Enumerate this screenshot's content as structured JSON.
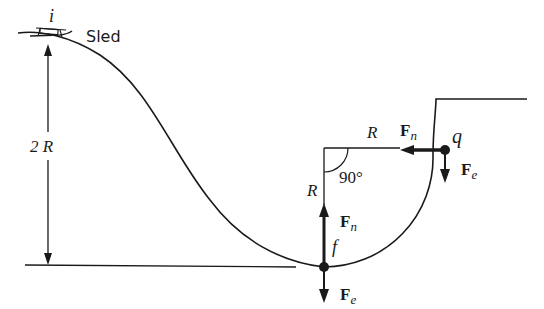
{
  "diagram": {
    "labels": {
      "point_i": "i",
      "sled": "Sled",
      "height": "2 R",
      "radius_horizontal": "R",
      "radius_vertical": "R",
      "angle": "90°",
      "point_f": "f",
      "point_q": "q"
    },
    "forces": {
      "at_f": [
        {
          "symbol": "F",
          "subscript": "n",
          "direction": "up"
        },
        {
          "symbol": "F",
          "subscript": "e",
          "direction": "down"
        }
      ],
      "at_q": [
        {
          "symbol": "F",
          "subscript": "n",
          "direction": "left"
        },
        {
          "symbol": "F",
          "subscript": "e",
          "direction": "down"
        }
      ]
    },
    "colors": {
      "line": "#1a1a1a",
      "background": "#ffffff"
    }
  }
}
